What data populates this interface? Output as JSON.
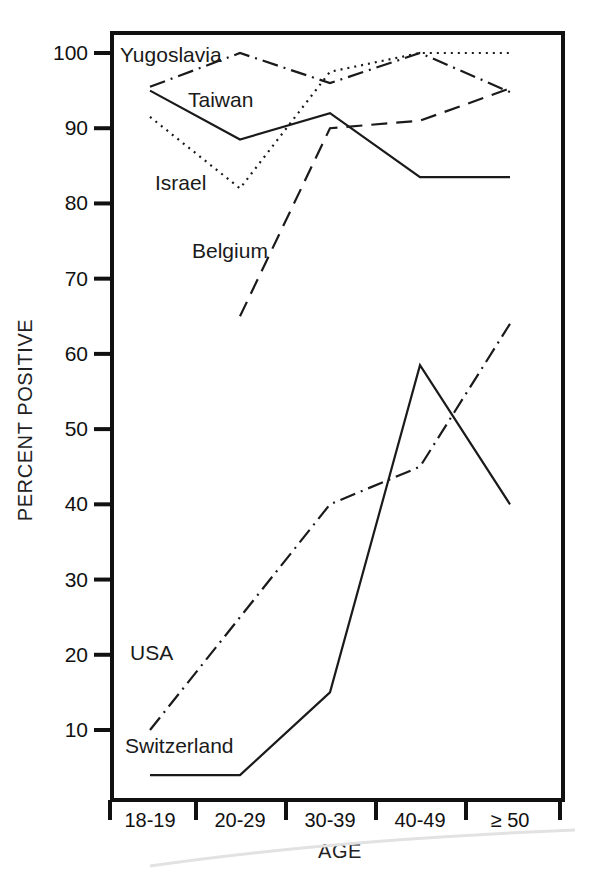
{
  "chart_data": {
    "type": "line",
    "title": "",
    "xlabel": "AGE",
    "ylabel": "PERCENT POSITIVE",
    "categories": [
      "18-19",
      "20-29",
      "30-39",
      "40-49",
      "≥ 50"
    ],
    "ytick_labels": [
      "100",
      "90",
      "80",
      "70",
      "60",
      "50",
      "40",
      "30",
      "20",
      "10"
    ],
    "ytick_values": [
      100,
      90,
      80,
      70,
      60,
      50,
      40,
      30,
      20,
      10
    ],
    "ylim": [
      3,
      103
    ],
    "grid": false,
    "legend": "inline-labels",
    "series": [
      {
        "name": "Yugoslavia",
        "style": "dash-dot",
        "values": [
          95.5,
          100,
          96,
          100,
          94.8
        ],
        "label_x": 120,
        "label_y": 62
      },
      {
        "name": "Taiwan",
        "style": "solid",
        "values": [
          95,
          88.5,
          92,
          83.5,
          83.5
        ],
        "label_x": 188,
        "label_y": 107
      },
      {
        "name": "Israel",
        "style": "dotted",
        "values": [
          91.5,
          82,
          97.5,
          100,
          100
        ],
        "label_x": 155,
        "label_y": 190
      },
      {
        "name": "Belgium",
        "style": "dashed",
        "values": [
          null,
          65,
          90,
          91,
          95.3
        ],
        "label_x": 192,
        "label_y": 258
      },
      {
        "name": "USA",
        "style": "dash-dot",
        "values": [
          10,
          25,
          40,
          45,
          64
        ],
        "label_x": 130,
        "label_y": 660
      },
      {
        "name": "Switzerland",
        "style": "solid",
        "values": [
          4,
          4,
          15,
          58.5,
          40
        ],
        "label_x": 125,
        "label_y": 753
      }
    ]
  },
  "plot_geometry": {
    "left": 112,
    "right": 563,
    "top": 33,
    "bottom": 800,
    "y100_px": 53,
    "y10_px": 730,
    "category_x": [
      150,
      240,
      330,
      420,
      510
    ],
    "xtick_x": [
      110,
      196,
      286,
      376,
      466,
      560
    ],
    "cat_label_y": 827,
    "xlabel_x": 340,
    "xlabel_y": 858,
    "ylabel_x": 32,
    "ylabel_y": 420
  }
}
